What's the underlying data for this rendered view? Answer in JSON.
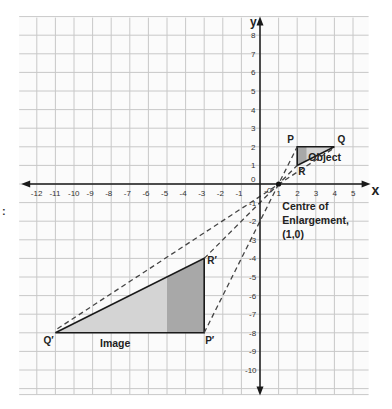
{
  "figure": {
    "type": "enlargement-diagram",
    "axes": {
      "x_label": "x",
      "y_label": "y",
      "x_ticks": [
        "-12",
        "-11",
        "-10",
        "-9",
        "-8",
        "-7",
        "-6",
        "-5",
        "-4",
        "-3",
        "-2",
        "-1",
        "0",
        "1",
        "2",
        "3",
        "4",
        "5"
      ],
      "y_ticks_positive": [
        "8",
        "7",
        "6",
        "5",
        "4",
        "3",
        "2",
        "1",
        "0"
      ],
      "y_ticks_negative": [
        "-1",
        "-2",
        "-3",
        "-4",
        "-5",
        "-6",
        "-7",
        "-8",
        "-9",
        "-10"
      ],
      "x_range": [
        -13,
        6
      ],
      "y_range": [
        -11,
        9
      ],
      "grid": true
    },
    "object": {
      "label": "Object",
      "points": {
        "P": {
          "label": "P",
          "x": 2,
          "y": 2
        },
        "Q": {
          "label": "Q",
          "x": 4,
          "y": 2
        },
        "R": {
          "label": "R",
          "x": 2,
          "y": 1
        }
      }
    },
    "image": {
      "label": "Image",
      "points": {
        "P": {
          "label": "P′",
          "x": -3,
          "y": -8
        },
        "Q": {
          "label": "Q′",
          "x": -11,
          "y": -8
        },
        "R": {
          "label": "R′",
          "x": -3,
          "y": -4
        }
      }
    },
    "centre": {
      "line1": "Centre of",
      "line2": "Enlargement,",
      "line3": "(1,0)",
      "x": 1,
      "y": 0
    },
    "scale_factor": -4,
    "colors": {
      "grid": "#c8c8c8",
      "axis": "#1a1a1a",
      "light_fill": "#d4d4d4",
      "dark_fill": "#a8a8a8",
      "dash": "#444444"
    },
    "edge_mark": ":"
  }
}
